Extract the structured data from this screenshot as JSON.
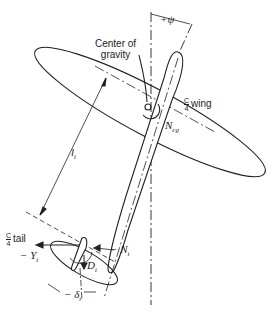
{
  "figure": {
    "labels": {
      "yaw_angle": "+ψ",
      "center_of_gravity": "Center of\ngravity",
      "cg_line1": "Center of",
      "cg_line2": "gravity",
      "quarter_chord_wing_frac_num": "C",
      "quarter_chord_wing_frac_den": "4",
      "quarter_chord_wing_text": "wing",
      "yaw_moment_cg": "N",
      "yaw_moment_cg_sub": "cg",
      "tail_arm": "l",
      "tail_arm_sub": "t",
      "quarter_chord_tail_frac_num": "C",
      "quarter_chord_tail_frac_den": "4",
      "quarter_chord_tail_text": "tail",
      "side_force_tail": "− Y",
      "side_force_tail_sub": "t",
      "yaw_moment_tail": "− N",
      "yaw_moment_tail_sub": "t",
      "drag_tail": "D",
      "drag_tail_sub": "t",
      "rudder_deflection": "− δ",
      "rudder_deflection_sub": "r"
    },
    "colors": {
      "ink": "#222222",
      "background": "#ffffff"
    }
  }
}
